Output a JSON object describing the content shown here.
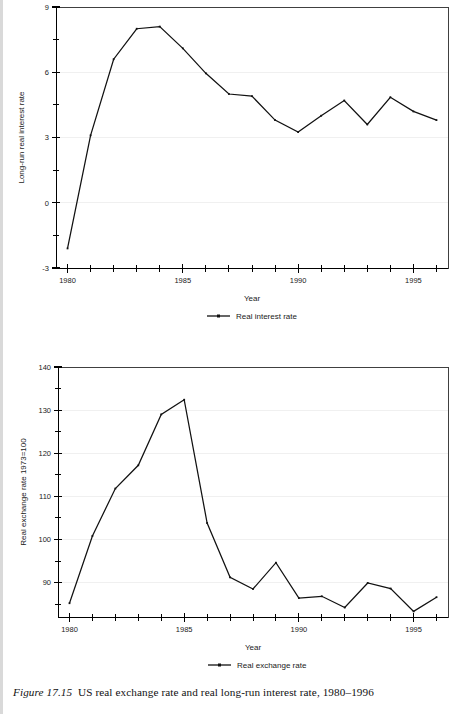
{
  "caption": {
    "figure_number": "Figure 17.15",
    "text": "US real exchange rate and real long-run interest rate, 1980–1996"
  },
  "colors": {
    "line": "#111111",
    "grid": "#f0f0f0",
    "frame": "#404040",
    "axis": "#000000",
    "background": "#ffffff"
  },
  "chart_data": [
    {
      "id": "interest-rate-chart",
      "type": "line",
      "title": "",
      "xlabel": "Year",
      "ylabel": "Long-run real interest rate",
      "legend": [
        "Real interest rate"
      ],
      "legend_position": "bottom-center",
      "grid": true,
      "xlim": [
        1979.5,
        1996.5
      ],
      "ylim": [
        -3,
        9
      ],
      "yticks": [
        -3,
        0,
        3,
        6,
        9
      ],
      "yticklabels": [
        "-3",
        "0",
        "3",
        "6",
        "9"
      ],
      "yminorticks": [
        -1.5,
        1.5,
        4.5,
        7.5
      ],
      "xticks": [
        1980,
        1981,
        1982,
        1983,
        1984,
        1985,
        1986,
        1987,
        1988,
        1989,
        1990,
        1991,
        1992,
        1993,
        1994,
        1995,
        1996
      ],
      "xticklabels": [
        "1980",
        "",
        "",
        "",
        "",
        "1985",
        "",
        "",
        "",
        "",
        "1990",
        "",
        "",
        "",
        "",
        "1995",
        ""
      ],
      "x": [
        1980,
        1981,
        1982,
        1983,
        1984,
        1985,
        1986,
        1987,
        1988,
        1989,
        1990,
        1991,
        1992,
        1993,
        1994,
        1995,
        1996
      ],
      "series": [
        {
          "name": "Real interest rate",
          "values": [
            -2.1,
            3.1,
            6.6,
            8.0,
            8.1,
            7.1,
            5.95,
            5.0,
            4.9,
            3.8,
            3.25,
            4.0,
            4.7,
            3.6,
            4.85,
            4.2,
            3.8
          ]
        }
      ]
    },
    {
      "id": "exchange-rate-chart",
      "type": "line",
      "title": "",
      "xlabel": "Year",
      "ylabel": "Real exchange rate 1973=100",
      "legend": [
        "Real exchange rate"
      ],
      "legend_position": "bottom-center",
      "grid": true,
      "xlim": [
        1979.5,
        1996.5
      ],
      "ylim": [
        82,
        140
      ],
      "yticks": [
        90,
        100,
        110,
        120,
        130,
        140
      ],
      "yticklabels": [
        "90",
        "100",
        "110",
        "120",
        "130",
        "140"
      ],
      "yminorticks": [
        85,
        95,
        105,
        115,
        125,
        135
      ],
      "xticks": [
        1980,
        1981,
        1982,
        1983,
        1984,
        1985,
        1986,
        1987,
        1988,
        1989,
        1990,
        1991,
        1992,
        1993,
        1994,
        1995,
        1996
      ],
      "xticklabels": [
        "1980",
        "",
        "",
        "",
        "",
        "1985",
        "",
        "",
        "",
        "",
        "1990",
        "",
        "",
        "",
        "",
        "1995",
        ""
      ],
      "x": [
        1980,
        1981,
        1982,
        1983,
        1984,
        1985,
        1986,
        1987,
        1988,
        1989,
        1990,
        1991,
        1992,
        1993,
        1994,
        1995,
        1996
      ],
      "series": [
        {
          "name": "Real exchange rate",
          "values": [
            85.2,
            100.8,
            111.8,
            117.2,
            129.0,
            132.4,
            103.8,
            91.2,
            88.5,
            94.6,
            86.4,
            86.8,
            84.2,
            89.9,
            88.6,
            83.3,
            86.6
          ]
        }
      ]
    }
  ]
}
